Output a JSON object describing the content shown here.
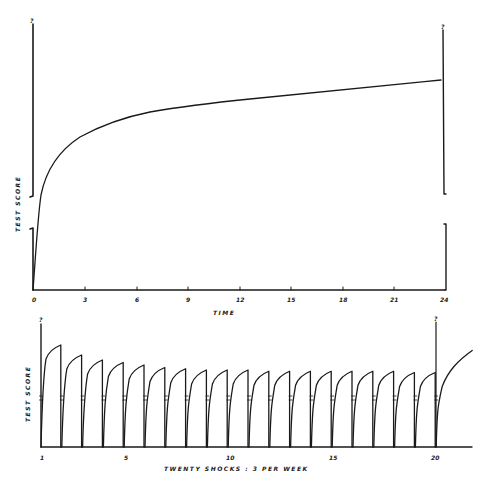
{
  "chart_data": [
    {
      "type": "line",
      "title": "",
      "xlabel": "TIME",
      "ylabel": "TEST SCORE",
      "x_ticks": [
        "0",
        "3",
        "6",
        "9",
        "12",
        "15",
        "18",
        "21",
        "24"
      ],
      "xlim": [
        0,
        24
      ],
      "ylim": "unspecified (axis topped with '?')",
      "y_axis_top_marker": "?",
      "right_axis_top_marker": "?",
      "axis_break": true,
      "grid": false,
      "series": [
        {
          "name": "test score over time",
          "x": [
            0,
            0.5,
            1,
            2,
            3,
            4,
            6,
            9,
            12,
            15,
            18,
            21,
            24
          ],
          "y_relative": [
            0,
            0.36,
            0.52,
            0.63,
            0.68,
            0.71,
            0.74,
            0.76,
            0.78,
            0.8,
            0.82,
            0.84,
            0.86
          ]
        }
      ]
    },
    {
      "type": "line",
      "title": "",
      "xlabel": "TWENTY SHOCKS : 3 PER WEEK",
      "ylabel": "TEST SCORE",
      "x_ticks": [
        "1",
        "5",
        "10",
        "15",
        "20"
      ],
      "xlim": [
        1,
        21.5
      ],
      "y_axis_top_marker": "?",
      "shock20_marker": "?",
      "grid": false,
      "shock_count": 20,
      "series": [
        {
          "name": "peak test score after each shock (relative)",
          "x": [
            1,
            2,
            3,
            4,
            5,
            6,
            7,
            8,
            9,
            10,
            11,
            12,
            13,
            14,
            15,
            16,
            17,
            18,
            19,
            20
          ],
          "y_relative": [
            0.8,
            0.72,
            0.68,
            0.66,
            0.64,
            0.62,
            0.61,
            0.6,
            0.6,
            0.6,
            0.59,
            0.59,
            0.59,
            0.59,
            0.59,
            0.59,
            0.59,
            0.58,
            0.58,
            0.58
          ]
        },
        {
          "name": "recovery after final shock",
          "x": [
            20,
            20.5,
            21,
            21.5
          ],
          "y_relative": [
            0,
            0.45,
            0.56,
            0.64
          ]
        }
      ]
    }
  ],
  "top_chart": {
    "y_label": "TEST SCORE",
    "x_label": "TIME",
    "y_top_marker": "?",
    "right_top_marker": "?",
    "x_ticks": [
      "0",
      "3",
      "6",
      "9",
      "12",
      "15",
      "18",
      "21",
      "24"
    ]
  },
  "bottom_chart": {
    "y_label": "TEST SCORE",
    "x_label": "TWENTY SHOCKS : 3 PER WEEK",
    "y_top_marker": "?",
    "shock20_marker": "?",
    "x_ticks": [
      "1",
      "5",
      "10",
      "15",
      "20"
    ]
  }
}
